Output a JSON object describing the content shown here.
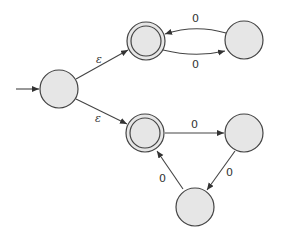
{
  "diagram": {
    "type": "nfa-state-diagram",
    "colors": {
      "state_fill": "#e6e6e6",
      "stroke": "#444444",
      "label": "#333333"
    },
    "states": [
      {
        "id": "q0",
        "start": true,
        "accepting": false,
        "cx": 59,
        "cy": 89
      },
      {
        "id": "q1",
        "start": false,
        "accepting": true,
        "cx": 146,
        "cy": 41
      },
      {
        "id": "q2",
        "start": false,
        "accepting": false,
        "cx": 244,
        "cy": 40
      },
      {
        "id": "q3",
        "start": false,
        "accepting": true,
        "cx": 145,
        "cy": 133
      },
      {
        "id": "q4",
        "start": false,
        "accepting": false,
        "cx": 244,
        "cy": 133
      },
      {
        "id": "q5",
        "start": false,
        "accepting": false,
        "cx": 195,
        "cy": 207
      }
    ],
    "transitions": [
      {
        "from": "q0",
        "to": "q1",
        "label": "ε"
      },
      {
        "from": "q0",
        "to": "q3",
        "label": "ε"
      },
      {
        "from": "q2",
        "to": "q1",
        "label": "0"
      },
      {
        "from": "q1",
        "to": "q2",
        "label": "0"
      },
      {
        "from": "q3",
        "to": "q4",
        "label": "0"
      },
      {
        "from": "q4",
        "to": "q5",
        "label": "0"
      },
      {
        "from": "q5",
        "to": "q3",
        "label": "0"
      }
    ]
  }
}
